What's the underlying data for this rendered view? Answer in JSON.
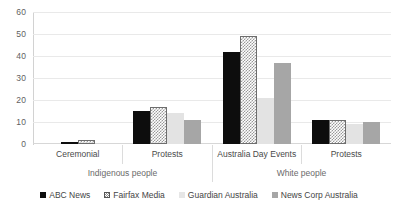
{
  "chart_data": {
    "type": "bar",
    "title": "",
    "subtitle": "",
    "xlabel": "",
    "ylabel": "",
    "ylim": [
      0,
      60
    ],
    "yticks": [
      "0",
      "10",
      "20",
      "30",
      "40",
      "50",
      "60"
    ],
    "grid": true,
    "legend_position": "bottom",
    "categories": [
      "Ceremonial",
      "Protests",
      "Australia Day Events",
      "Protests"
    ],
    "supergroups": [
      {
        "label": "Indigenous people",
        "span": 2
      },
      {
        "label": "White people",
        "span": 2
      }
    ],
    "series": [
      {
        "name": "ABC News",
        "color": "#0d0d0d",
        "values": [
          1,
          15,
          42,
          11
        ]
      },
      {
        "name": "Fairfax Media",
        "color": "#ffffff",
        "values": [
          2,
          17,
          49,
          11
        ]
      },
      {
        "name": "Guardian Australia",
        "color": "#e3e3e3",
        "values": [
          0,
          14,
          21,
          9
        ]
      },
      {
        "name": "News Corp Australia",
        "color": "#a6a6a6",
        "values": [
          0,
          11,
          37,
          10
        ]
      }
    ]
  },
  "axis": {
    "y_ticks": [
      {
        "value": 60,
        "label": "60"
      },
      {
        "value": 50,
        "label": "50"
      },
      {
        "value": 40,
        "label": "40"
      },
      {
        "value": 30,
        "label": "30"
      },
      {
        "value": 20,
        "label": "20"
      },
      {
        "value": 10,
        "label": "10"
      },
      {
        "value": 0,
        "label": "0"
      }
    ]
  },
  "x_axis": {
    "category_labels": [
      "Ceremonial",
      "Protests",
      "Australia Day Events",
      "Protests"
    ],
    "group_labels": [
      "Indigenous people",
      "White people"
    ]
  },
  "legend": {
    "items": [
      {
        "label": "ABC News",
        "swatch": "legend-swatch-abc-news"
      },
      {
        "label": "Fairfax Media",
        "swatch": "legend-swatch-fairfax-media"
      },
      {
        "label": "Guardian Australia",
        "swatch": "legend-swatch-guardian-australia"
      },
      {
        "label": "News Corp Australia",
        "swatch": "legend-swatch-news-corp-australia"
      }
    ]
  }
}
